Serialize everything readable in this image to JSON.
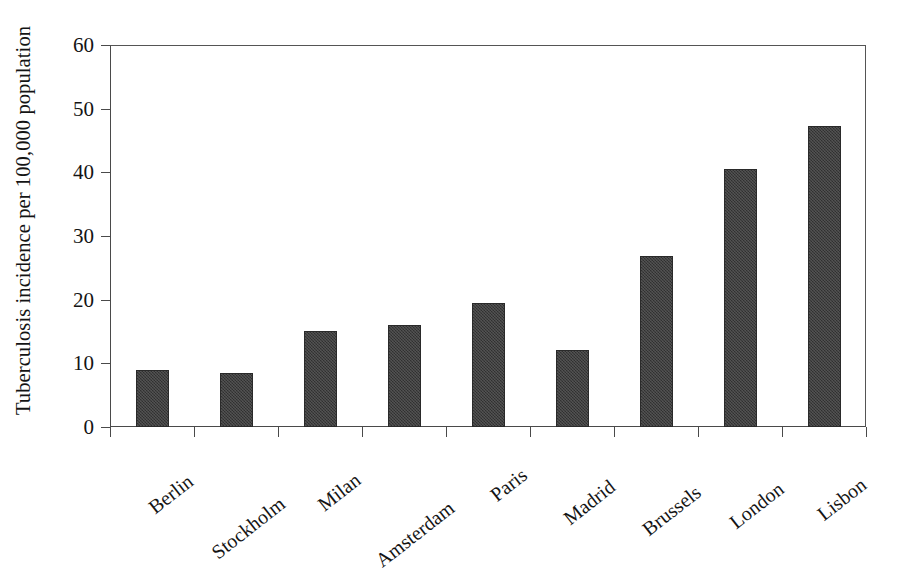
{
  "chart_data": {
    "type": "bar",
    "title": "",
    "xlabel": "",
    "ylabel": "Tuberculosis incidence per 100,000 population",
    "categories": [
      "Berlin",
      "Stockholm",
      "Milan",
      "Amsterdam",
      "Paris",
      "Madrid",
      "Brussels",
      "London",
      "Lisbon"
    ],
    "values": [
      9.0,
      8.5,
      15.1,
      16.0,
      19.5,
      12.1,
      26.8,
      40.5,
      47.2
    ],
    "ylim": [
      0,
      60
    ],
    "yticks": [
      0,
      10,
      20,
      30,
      40,
      50,
      60
    ],
    "ytick_labels": [
      "0",
      "10",
      "20",
      "30",
      "40",
      "50",
      "60"
    ],
    "grid": false,
    "legend": null,
    "bar_color": "#3b3b3b",
    "axis_color": "#4a4a4a",
    "background_color": "#ffffff"
  }
}
